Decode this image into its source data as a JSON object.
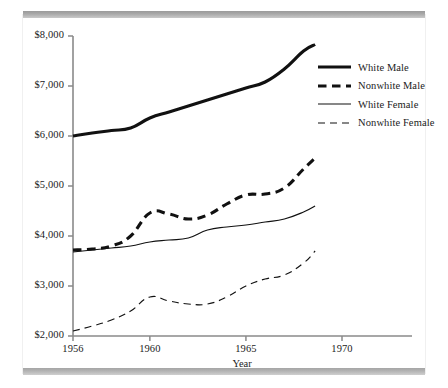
{
  "chart_data": {
    "type": "line",
    "title": "",
    "xlabel": "Year",
    "ylabel": "",
    "xlim": [
      1956,
      1971.2
    ],
    "ylim": [
      2000,
      8000
    ],
    "grid": false,
    "legend_position": "right-top",
    "y_ticks": [
      "$2,000",
      "$3,000",
      "$4,000",
      "$5,000",
      "$6,000",
      "$7,000",
      "$8,000"
    ],
    "y_tick_values": [
      2000,
      3000,
      4000,
      5000,
      6000,
      7000,
      8000
    ],
    "x_ticks": [
      "1956",
      "1960",
      "1965",
      "1970"
    ],
    "x_tick_values": [
      1956,
      1960,
      1965,
      1970
    ],
    "x": [
      1956,
      1957,
      1958,
      1959,
      1960,
      1961,
      1962,
      1963,
      1964,
      1965,
      1966,
      1967,
      1968,
      1968.6
    ],
    "series": [
      {
        "name": "White Male",
        "style": "solid-thick",
        "values": [
          6000,
          6060,
          6110,
          6160,
          6360,
          6480,
          6600,
          6720,
          6840,
          6960,
          7080,
          7340,
          7700,
          7830
        ]
      },
      {
        "name": "Nonwhite Male",
        "style": "dashed-thick",
        "values": [
          3720,
          3740,
          3800,
          4000,
          4460,
          4440,
          4340,
          4420,
          4640,
          4820,
          4840,
          4960,
          5340,
          5560
        ]
      },
      {
        "name": "White Female",
        "style": "solid-thin",
        "values": [
          3680,
          3720,
          3760,
          3800,
          3880,
          3920,
          3960,
          4120,
          4180,
          4220,
          4280,
          4340,
          4480,
          4600
        ]
      },
      {
        "name": "Nonwhite Female",
        "style": "dashed-thin",
        "values": [
          2100,
          2200,
          2320,
          2500,
          2780,
          2700,
          2640,
          2640,
          2780,
          3000,
          3140,
          3220,
          3460,
          3700
        ]
      }
    ]
  },
  "legend": {
    "entries": [
      {
        "label": "White Male"
      },
      {
        "label": "Nonwhite Male"
      },
      {
        "label": "White Female"
      },
      {
        "label": "Nonwhite Female"
      }
    ]
  },
  "axes": {
    "x_axis_title": "Year"
  },
  "colors": {
    "line": "#111111",
    "axis": "#8a8a8a",
    "text": "#1b1b1b",
    "frame_bar": "#a5a5a5",
    "background": "#ffffff"
  }
}
